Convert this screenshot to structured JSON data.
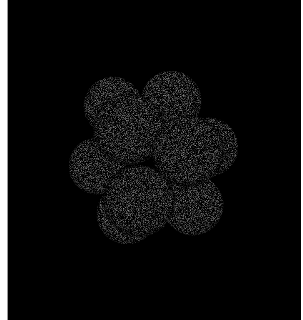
{
  "image": {
    "description": "Grayscale microscopy image of a cluster of round cells (embryo, ~8-cell stage) on black background",
    "background_color": "#000000",
    "border_color": "#ffffff",
    "cell_color": "#9c9c9c",
    "cells": [
      {
        "cx": 113,
        "cy": 106,
        "r": 29,
        "layer": "back"
      },
      {
        "cx": 171,
        "cy": 101,
        "r": 30,
        "layer": "back"
      },
      {
        "cx": 209,
        "cy": 147,
        "r": 29,
        "layer": "back"
      },
      {
        "cx": 97,
        "cy": 166,
        "r": 28,
        "layer": "back"
      },
      {
        "cx": 127,
        "cy": 214,
        "r": 30,
        "layer": "back"
      },
      {
        "cx": 193,
        "cy": 205,
        "r": 30,
        "layer": "back"
      },
      {
        "cx": 129,
        "cy": 129,
        "r": 35,
        "layer": "front"
      },
      {
        "cx": 188,
        "cy": 151,
        "r": 35,
        "layer": "front"
      },
      {
        "cx": 139,
        "cy": 201,
        "r": 35,
        "layer": "front"
      }
    ]
  }
}
